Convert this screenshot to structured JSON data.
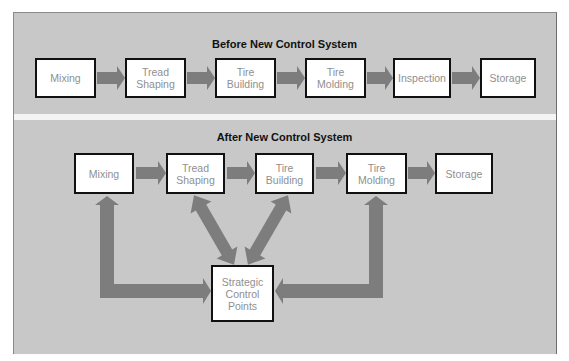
{
  "before": {
    "title": "Before New Control System",
    "steps": [
      {
        "line1": "Mixing",
        "line2": ""
      },
      {
        "line1": "Tread",
        "line2": "Shaping"
      },
      {
        "line1": "Tire",
        "line2": "Building"
      },
      {
        "line1": "Tire",
        "line2": "Molding"
      },
      {
        "line1": "Inspection",
        "line2": ""
      },
      {
        "line1": "Storage",
        "line2": ""
      }
    ]
  },
  "after": {
    "title": "After New Control System",
    "steps": [
      {
        "line1": "Mixing",
        "line2": ""
      },
      {
        "line1": "Tread",
        "line2": "Shaping"
      },
      {
        "line1": "Tire",
        "line2": "Building"
      },
      {
        "line1": "Tire",
        "line2": "Molding"
      },
      {
        "line1": "Storage",
        "line2": ""
      }
    ],
    "control": {
      "line1": "Strategic",
      "line2": "Control",
      "line3": "Points"
    }
  },
  "colors": {
    "panel_bg": "#c8c8c8",
    "arrow": "#7d7d7d",
    "box_border": "#111111",
    "box_text": "#8f8f8f",
    "divider": "#f4f4f4"
  }
}
